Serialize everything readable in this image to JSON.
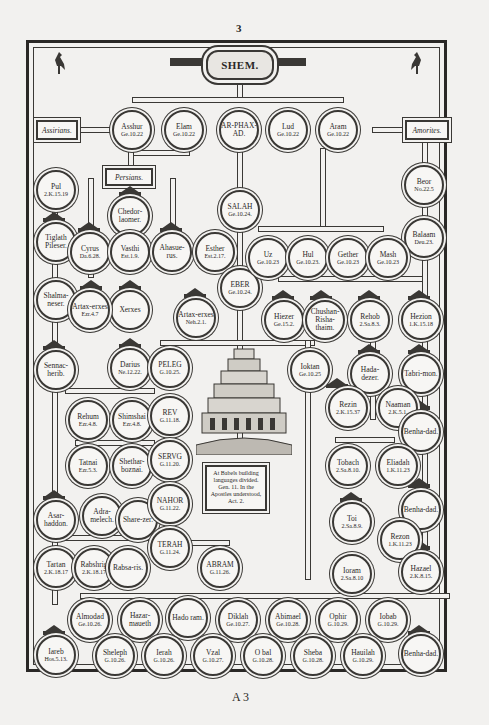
{
  "page": {
    "number": "3",
    "signature": "A 3"
  },
  "title": "SHEM.",
  "labels": {
    "assyrians": "Assirians.",
    "persians": "Persians.",
    "amorites": "Amorites."
  },
  "babel_note": "At Babels building languages divided. Gen. 11. In the Apostles understood, Act. 2.",
  "nodes": {
    "asshur": {
      "name": "Asshur",
      "ref": "Ge.10.22"
    },
    "elam": {
      "name": "Elam",
      "ref": "Ge.10.22"
    },
    "arphaxad": {
      "name": "AR-PHAX-AD.",
      "ref": ""
    },
    "lud": {
      "name": "Lud",
      "ref": "Ge.10.22"
    },
    "aram": {
      "name": "Aram",
      "ref": "Ge.10.22"
    },
    "beor": {
      "name": "Beor",
      "ref": "No.22.5"
    },
    "balaam": {
      "name": "Balaam",
      "ref": "Deu.23."
    },
    "pul": {
      "name": "Pul",
      "ref": "2.K.15.19"
    },
    "tiglath": {
      "name": "Tiglath Pileser.",
      "ref": ""
    },
    "shalmaneser": {
      "name": "Shalma-neser.",
      "ref": ""
    },
    "sennacherib": {
      "name": "Sennac-herib.",
      "ref": ""
    },
    "chedorlaomer": {
      "name": "Chedor-laomer.",
      "ref": ""
    },
    "cyrus": {
      "name": "Cyrus",
      "ref": "Da.6.28."
    },
    "vasthi": {
      "name": "Vasthi",
      "ref": "Est.1.9."
    },
    "ahasuerus": {
      "name": "Ahasue-rus.",
      "ref": ""
    },
    "esther": {
      "name": "Esther",
      "ref": "Est.2.17."
    },
    "xerxes": {
      "name": "Xerxes",
      "ref": ""
    },
    "artaxerxes1": {
      "name": "Artax-erxes",
      "ref": "Ezr.4.7"
    },
    "artaxerxes2": {
      "name": "Artax-erxes",
      "ref": "Neh.2.1."
    },
    "salah": {
      "name": "SALAH",
      "ref": "Ge.10.24."
    },
    "eber": {
      "name": "EBER",
      "ref": "Ge.10.24."
    },
    "uz": {
      "name": "Uz",
      "ref": "Ge.10.23"
    },
    "hul": {
      "name": "Hul",
      "ref": "Ge.10.23."
    },
    "gether": {
      "name": "Gether",
      "ref": "Ge.10.23"
    },
    "mash": {
      "name": "Mash",
      "ref": "Ge.10.23"
    },
    "hiezer": {
      "name": "Hiezer",
      "ref": "Ge.15.2."
    },
    "chushan": {
      "name": "Chushan-Risha-thaim.",
      "ref": ""
    },
    "rehob": {
      "name": "Rehob",
      "ref": "2.Sa.8.3."
    },
    "hezion": {
      "name": "Hezion",
      "ref": "1.K.15.18"
    },
    "darius": {
      "name": "Darius",
      "ref": "Ne.12.22."
    },
    "peleg": {
      "name": "PELEG",
      "ref": "G.10.25."
    },
    "joktan": {
      "name": "Ioktan",
      "ref": "Ge.10.25"
    },
    "hadadezer": {
      "name": "Hada-dezer.",
      "ref": ""
    },
    "tabrimon": {
      "name": "Tabri-mon.",
      "ref": ""
    },
    "rehum": {
      "name": "Rehum",
      "ref": "Ezr.4.8."
    },
    "shimshai": {
      "name": "Shimshai",
      "ref": "Ezr.4.8."
    },
    "reu": {
      "name": "REV",
      "ref": "G.11.18."
    },
    "rezin": {
      "name": "Rezin",
      "ref": "2.K.15.37"
    },
    "naaman": {
      "name": "Naaman",
      "ref": "2.K.5.1."
    },
    "benhadad1": {
      "name": "Benha-dad.",
      "ref": ""
    },
    "tatnai": {
      "name": "Tatnai",
      "ref": "Ezr.5.3."
    },
    "shetharboznai": {
      "name": "Shethar-boznai.",
      "ref": ""
    },
    "serug": {
      "name": "SERVG",
      "ref": "G.11.20."
    },
    "tobach": {
      "name": "Tobach",
      "ref": "2.Sa.8.10."
    },
    "eliadah": {
      "name": "Eliadah",
      "ref": "1.K.11.23"
    },
    "esarhaddon": {
      "name": "Asar-haddon.",
      "ref": ""
    },
    "adrammelech": {
      "name": "Adra-melech.",
      "ref": ""
    },
    "sharezer": {
      "name": "Share-zer.",
      "ref": ""
    },
    "nahor": {
      "name": "NAHOR",
      "ref": "G.11.22."
    },
    "toi": {
      "name": "Toi",
      "ref": "2.Sa.8.9."
    },
    "benhadad2": {
      "name": "Benha-dad.",
      "ref": ""
    },
    "terah": {
      "name": "TERAH",
      "ref": "G.11.24."
    },
    "rezon": {
      "name": "Rezon",
      "ref": "1.K.11.23"
    },
    "tartan": {
      "name": "Tartan",
      "ref": "2.K.18.17"
    },
    "rabshakeh": {
      "name": "Rabshrig",
      "ref": "2.K.18.17"
    },
    "rabsaris": {
      "name": "Rabsa-ris.",
      "ref": ""
    },
    "abram": {
      "name": "ABRAM",
      "ref": "G.11.26."
    },
    "joram": {
      "name": "Ioram",
      "ref": "2.Sa.8.10"
    },
    "hazael": {
      "name": "Hazael",
      "ref": "2.K.8.15."
    },
    "almodad": {
      "name": "Almodad",
      "ref": "Ge.10.26."
    },
    "hazarmaveth": {
      "name": "Hazar-maueth",
      "ref": ""
    },
    "hadoram": {
      "name": "Hado ram.",
      "ref": ""
    },
    "diklah": {
      "name": "Diklah",
      "ref": "Ge.10.27."
    },
    "abimael": {
      "name": "Abimael",
      "ref": "Ge.10.28."
    },
    "ophir": {
      "name": "Ophir",
      "ref": "G.10.29."
    },
    "jobab": {
      "name": "Iobab",
      "ref": "G.10.29."
    },
    "jareb": {
      "name": "Iareb",
      "ref": "Hos.5.13."
    },
    "sheleph": {
      "name": "Sheleph",
      "ref": "G.10.26."
    },
    "jerah": {
      "name": "Ierah",
      "ref": "G.10.26."
    },
    "uzal": {
      "name": "Vzal",
      "ref": "G.10.27."
    },
    "obal": {
      "name": "O bal",
      "ref": "G.10.28."
    },
    "sheba": {
      "name": "Sheba",
      "ref": "G.10.28."
    },
    "havilah": {
      "name": "Hauilah",
      "ref": "G.10.29."
    },
    "benhadad3": {
      "name": "Benha-dad.",
      "ref": ""
    }
  },
  "colors": {
    "ink": "#2a2826",
    "paper": "#f2f1ef"
  }
}
